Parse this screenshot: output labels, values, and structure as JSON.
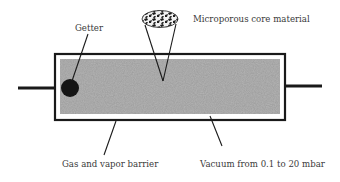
{
  "diagram": {
    "labels": {
      "getter": "Getter",
      "core": "Microporous core material",
      "barrier": "Gas and vapor barrier",
      "vacuum": "Vacuum from 0.1 to 20 mbar"
    },
    "colors": {
      "outline": "#1a1a1a",
      "core_fill": "#b4b4b4",
      "getter": "#141414",
      "text": "#3a3a3a"
    }
  }
}
